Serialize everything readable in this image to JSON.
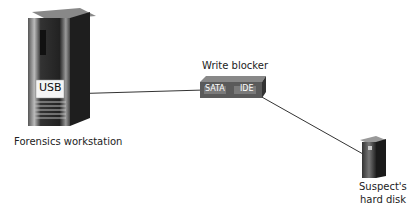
{
  "diagram": {
    "workstation": {
      "label": "Forensics workstation",
      "port_label": "USB"
    },
    "write_blocker": {
      "label": "Write blocker",
      "port_left": "SATA",
      "port_right": "IDE"
    },
    "suspect": {
      "label_line1": "Suspect's",
      "label_line2": "hard disk"
    },
    "colors": {
      "line": "#333333",
      "tower_dark": "#2a2a2a",
      "tower_mid": "#777777",
      "blocker": "#5a5a5a"
    }
  }
}
